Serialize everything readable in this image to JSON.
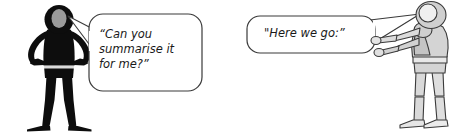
{
  "scene": {
    "title": "Two stick figures conversation illustration",
    "background_color": "#ffffff",
    "width": 466,
    "height": 138
  },
  "figures": [
    {
      "id": "figure-left",
      "name": "black-silhouette-figure",
      "pose": "hands on hips",
      "body_color": "#0d0d0d",
      "face_color": "#9a9a9a",
      "outline_color": "#0d0d0d"
    },
    {
      "id": "figure-right",
      "name": "grey-mannequin-figure",
      "pose": "arms extended forward pointing",
      "body_color": "#d4d4d4",
      "face_color": "#cfcfcf",
      "highlight_color": "#efefef",
      "outline_color": "#3a3a3a"
    }
  ],
  "bubbles": [
    {
      "id": "bubble-left",
      "speaker": "figure-left",
      "text": "“Can you\nsummarise it\nfor me?”",
      "lines": [
        "“Can you",
        "summarise it",
        "for me?”"
      ],
      "fill_color": "#ffffff",
      "outline_color": "#3a3a3a",
      "tail_direction": "left"
    },
    {
      "id": "bubble-right",
      "speaker": "figure-right",
      "text": "\"Here we go:”",
      "lines": [
        "\"Here we go:”"
      ],
      "fill_color": "#ffffff",
      "outline_color": "#3a3a3a",
      "tail_direction": "right"
    }
  ]
}
